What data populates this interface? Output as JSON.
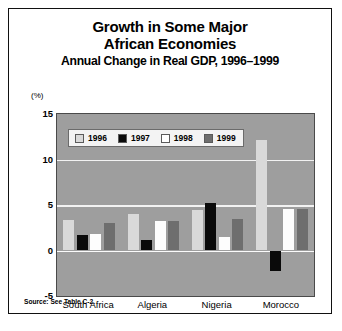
{
  "figure": {
    "title_lines": [
      "Growth in Some Major",
      "African Economies"
    ],
    "subtitle": "Annual Change in Real GDP, 1996–1999",
    "unit_label": "(%)",
    "source_note": "Source: See Table C-2."
  },
  "chart_data": {
    "type": "bar",
    "title": "Growth in Some Major African Economies",
    "subtitle": "Annual Change in Real GDP, 1996–1999",
    "xlabel": "",
    "ylabel": "(%)",
    "ylim": [
      -5,
      15
    ],
    "yticks": [
      15,
      10,
      5,
      0,
      -5
    ],
    "ytick_labels": [
      "15",
      "10",
      "5",
      "0",
      "-5"
    ],
    "grid": true,
    "legend_position": "upper-left-inside",
    "categories": [
      "South Africa",
      "Algeria",
      "Nigeria",
      "Morocco"
    ],
    "series": [
      {
        "name": "1996",
        "color": "#d9d9d9",
        "values": [
          3.4,
          4.0,
          4.5,
          12.1
        ]
      },
      {
        "name": "1997",
        "color": "#0a0a0a",
        "values": [
          1.7,
          1.2,
          5.2,
          -2.2
        ]
      },
      {
        "name": "1998",
        "color": "#ffffff",
        "values": [
          1.8,
          3.2,
          1.5,
          4.6
        ]
      },
      {
        "name": "1999",
        "color": "#6e6e6e",
        "values": [
          3.0,
          3.2,
          3.5,
          4.6
        ]
      }
    ]
  }
}
